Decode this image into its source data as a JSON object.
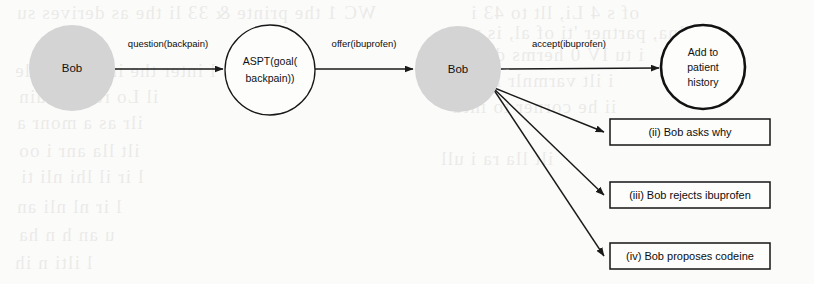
{
  "figure": {
    "background_color": "#fbfbfa",
    "ink_color": "#1a1a1a",
    "agent_fill_color": "#d4d4d4",
    "node_fill_color": "#fdfdfc"
  },
  "nodes": {
    "bob_start": {
      "label": "Bob",
      "shape": "circle",
      "fill": "#d4d4d4",
      "cx": 72,
      "cy": 68,
      "r": 43
    },
    "aspt": {
      "line1": "ASPT(goal(",
      "line2": "backpain))",
      "shape": "circle",
      "fill": "#fdfdfc",
      "cx": 270,
      "cy": 70,
      "r": 45
    },
    "bob_mid": {
      "label": "Bob",
      "shape": "circle",
      "fill": "#d4d4d4",
      "cx": 458,
      "cy": 69,
      "r": 43
    },
    "add_history": {
      "line1": "Add to",
      "line2": "patient",
      "line3": "history",
      "shape": "circle-thick",
      "fill": "#fdfdfc",
      "cx": 703,
      "cy": 67,
      "r": 42
    }
  },
  "edges": {
    "question": {
      "label": "question(backpain)",
      "from": "bob_start",
      "to": "aspt",
      "label_x": 168,
      "label_y": 47
    },
    "offer": {
      "label": "offer(ibuprofen)",
      "from": "aspt",
      "to": "bob_mid",
      "label_x": 364,
      "label_y": 47
    },
    "accept": {
      "label": "accept(ibuprofen)",
      "from": "bob_mid",
      "to": "add_history",
      "label_x": 569,
      "label_y": 47
    }
  },
  "outcome_boxes": [
    {
      "label": "(ii) Bob asks why",
      "x": 610,
      "y": 119,
      "width": 160,
      "height": 26
    },
    {
      "label": "(iii) Bob rejects ibuprofen",
      "x": 610,
      "y": 182,
      "width": 160,
      "height": 26
    },
    {
      "label": "(iv) Bob proposes codeine",
      "x": 610,
      "y": 243,
      "width": 160,
      "height": 26
    }
  ],
  "branch_origin": {
    "x": 492,
    "y": 87
  },
  "ghost_text": [
    {
      "text": "the as derives su",
      "x": 16,
      "y": 2
    },
    {
      "text": "WC  1 the printe & 33 li",
      "x": 168,
      "y": 2
    },
    {
      "text": "of  s  4 Li, llt to  43 i",
      "x": 470,
      "y": 2
    },
    {
      "text": "llna, partner 'ti  of  al, is v",
      "x": 470,
      "y": 22
    },
    {
      "text": "i tu  IV 0 herms du  res",
      "x": 452,
      "y": 44
    },
    {
      "text": "l  inter the inclu ble  ole",
      "x": 14,
      "y": 60
    },
    {
      "text": "i   ilt  varmnlr  i   nla",
      "x": 462,
      "y": 70
    },
    {
      "text": "il   Lo  ra  nliniuin",
      "x": 18,
      "y": 86
    },
    {
      "text": "ii  he  corner  to  intd",
      "x": 452,
      "y": 96
    },
    {
      "text": "ilr  as  a  monr  a",
      "x": 16,
      "y": 112
    },
    {
      "text": "ilt  lla  anr  i   oo",
      "x": 18,
      "y": 140
    },
    {
      "text": "ilt  lla  ra  i   ull",
      "x": 440,
      "y": 148
    },
    {
      "text": "l  ir  il   lhi  nli  ti",
      "x": 20,
      "y": 166
    },
    {
      "text": "l  ir  nl  nli  an",
      "x": 16,
      "y": 196
    },
    {
      "text": "u  an  h  n  ha",
      "x": 18,
      "y": 224
    },
    {
      "text": "l  ilti  n  ih",
      "x": 14,
      "y": 252
    }
  ]
}
